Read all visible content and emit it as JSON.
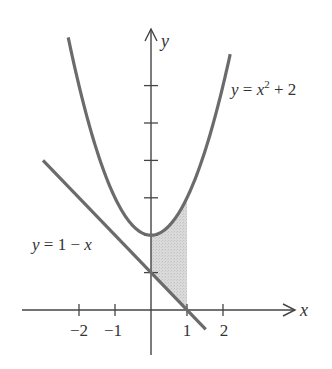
{
  "figure": {
    "type": "function-plot",
    "colors": {
      "background": "#ffffff",
      "axis": "#444444",
      "curve": "#6b6b6b",
      "shading": "#d2d2d2",
      "text": "#333333"
    }
  },
  "axes": {
    "x_label": "x",
    "y_label": "y",
    "x_ticks": [
      {
        "value": -2,
        "label": "−2"
      },
      {
        "value": -1,
        "label": "−1"
      },
      {
        "value": 1,
        "label": "1"
      },
      {
        "value": 2,
        "label": "2"
      }
    ],
    "y_ticks": [
      1,
      2,
      3,
      4,
      5,
      6
    ]
  },
  "curves": [
    {
      "id": "parabola",
      "label_parts": {
        "lhs": "y",
        "eq": " = ",
        "var": "x",
        "exp": "2",
        "rest": " + 2"
      },
      "expression": "y = x^2 + 2",
      "domain": [
        -2.3,
        2.2
      ]
    },
    {
      "id": "line",
      "label_parts": {
        "lhs": "y",
        "eq": " = 1 − ",
        "var": "x"
      },
      "expression": "y = 1 - x",
      "domain": [
        -3.0,
        1.52
      ]
    }
  ],
  "shaded_region": {
    "between": [
      "y = x^2 + 2",
      "y = 1 - x"
    ],
    "x_from": 0,
    "x_to": 1
  },
  "chart_data": {
    "type": "line",
    "title": "",
    "xlabel": "x",
    "ylabel": "y",
    "xlim": [
      -3.6,
      4.0
    ],
    "ylim": [
      -1.2,
      7.5
    ],
    "grid": false,
    "x_ticks": [
      -2,
      -1,
      1,
      2
    ],
    "y_ticks": [
      1,
      2,
      3,
      4,
      5,
      6
    ],
    "series": [
      {
        "name": "y = x^2 + 2",
        "x": [
          -2.3,
          -2,
          -1.5,
          -1,
          -0.5,
          0,
          0.5,
          1,
          1.5,
          2,
          2.2
        ],
        "y": [
          7.29,
          6,
          4.25,
          3,
          2.25,
          2,
          2.25,
          3,
          4.25,
          6,
          6.84
        ]
      },
      {
        "name": "y = 1 - x",
        "x": [
          -3,
          -2,
          -1,
          0,
          1,
          1.52
        ],
        "y": [
          4,
          3,
          2,
          1,
          0,
          -0.52
        ]
      }
    ],
    "annotations": [
      {
        "text": "y = x² + 2",
        "near": "right branch of parabola"
      },
      {
        "text": "y = 1 − x",
        "near": "left of line"
      },
      {
        "text": "shaded region",
        "x_range": [
          0,
          1
        ]
      }
    ]
  }
}
